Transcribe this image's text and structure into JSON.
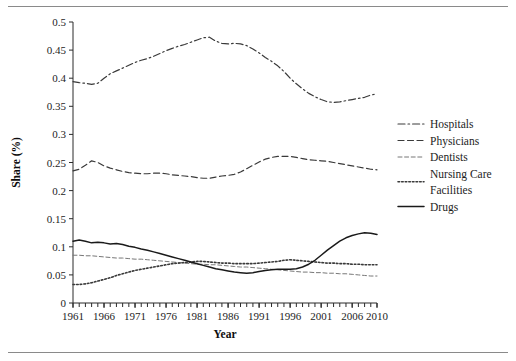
{
  "figure": {
    "has_top_rule": true,
    "has_bottom_rule": true,
    "background": "#ffffff",
    "line_color": "#333333"
  },
  "chart_data": {
    "type": "line",
    "title": "",
    "subtitle": "",
    "xlabel": "Year",
    "ylabel": "Share (%)",
    "xlim": [
      1961,
      2010
    ],
    "ylim": [
      0,
      0.5
    ],
    "grid": false,
    "legend_position": "right",
    "y_ticks": [
      0,
      0.05,
      0.1,
      0.15,
      0.2,
      0.25,
      0.3,
      0.35,
      0.4,
      0.45,
      0.5
    ],
    "y_tick_labels": [
      "0",
      "0.05",
      "0.1",
      "0.15",
      "0.2",
      "0.25",
      "0.3",
      "0.35",
      "0.4",
      "0.45",
      "0.5"
    ],
    "x_ticks": [
      1961,
      1966,
      1971,
      1976,
      1981,
      1986,
      1991,
      1996,
      2001,
      2006,
      2010
    ],
    "x_tick_labels": [
      "1961",
      "1966",
      "1971",
      "1976",
      "1981",
      "1986",
      "1991",
      "1996",
      "2001",
      "2006",
      "2010"
    ],
    "x_minor_tick_step": 1,
    "x": [
      1961,
      1962,
      1963,
      1964,
      1965,
      1966,
      1967,
      1968,
      1969,
      1970,
      1971,
      1972,
      1973,
      1974,
      1975,
      1976,
      1977,
      1978,
      1979,
      1980,
      1981,
      1982,
      1983,
      1984,
      1985,
      1986,
      1987,
      1988,
      1989,
      1990,
      1991,
      1992,
      1993,
      1994,
      1995,
      1996,
      1997,
      1998,
      1999,
      2000,
      2001,
      2002,
      2003,
      2004,
      2005,
      2006,
      2007,
      2008,
      2009,
      2010
    ],
    "series": [
      {
        "name": "Hospitals",
        "style": "dashdot",
        "color": "#3a3a3a",
        "values": [
          0.394,
          0.392,
          0.391,
          0.389,
          0.391,
          0.4,
          0.408,
          0.413,
          0.418,
          0.423,
          0.428,
          0.432,
          0.435,
          0.439,
          0.444,
          0.449,
          0.453,
          0.457,
          0.46,
          0.464,
          0.468,
          0.472,
          0.473,
          0.466,
          0.462,
          0.461,
          0.462,
          0.461,
          0.458,
          0.452,
          0.445,
          0.437,
          0.43,
          0.422,
          0.412,
          0.4,
          0.39,
          0.381,
          0.373,
          0.367,
          0.362,
          0.358,
          0.357,
          0.358,
          0.36,
          0.362,
          0.364,
          0.366,
          0.37,
          0.372
        ]
      },
      {
        "name": "Physicians",
        "style": "dashed",
        "color": "#3a3a3a",
        "values": [
          0.235,
          0.238,
          0.245,
          0.253,
          0.25,
          0.244,
          0.24,
          0.237,
          0.234,
          0.232,
          0.231,
          0.23,
          0.23,
          0.231,
          0.231,
          0.23,
          0.228,
          0.227,
          0.226,
          0.225,
          0.223,
          0.222,
          0.222,
          0.224,
          0.226,
          0.227,
          0.229,
          0.233,
          0.239,
          0.245,
          0.251,
          0.256,
          0.259,
          0.261,
          0.261,
          0.261,
          0.259,
          0.257,
          0.255,
          0.254,
          0.253,
          0.252,
          0.25,
          0.248,
          0.246,
          0.244,
          0.242,
          0.24,
          0.238,
          0.237
        ]
      },
      {
        "name": "Dentists",
        "style": "finedash",
        "color": "#777777",
        "values": [
          0.085,
          0.085,
          0.084,
          0.084,
          0.083,
          0.082,
          0.081,
          0.08,
          0.08,
          0.079,
          0.078,
          0.078,
          0.077,
          0.076,
          0.075,
          0.074,
          0.073,
          0.072,
          0.071,
          0.07,
          0.069,
          0.069,
          0.068,
          0.068,
          0.067,
          0.066,
          0.065,
          0.064,
          0.064,
          0.063,
          0.062,
          0.061,
          0.06,
          0.059,
          0.058,
          0.057,
          0.056,
          0.055,
          0.055,
          0.054,
          0.054,
          0.053,
          0.053,
          0.052,
          0.052,
          0.051,
          0.05,
          0.049,
          0.048,
          0.048
        ]
      },
      {
        "name": "Nursing Care Facilities",
        "style": "dotted",
        "color": "#3a3a3a",
        "values": [
          0.033,
          0.033,
          0.034,
          0.036,
          0.039,
          0.042,
          0.045,
          0.049,
          0.052,
          0.055,
          0.058,
          0.06,
          0.062,
          0.064,
          0.066,
          0.068,
          0.07,
          0.071,
          0.072,
          0.073,
          0.074,
          0.074,
          0.073,
          0.072,
          0.071,
          0.071,
          0.07,
          0.07,
          0.07,
          0.07,
          0.071,
          0.072,
          0.073,
          0.074,
          0.076,
          0.077,
          0.076,
          0.075,
          0.074,
          0.073,
          0.072,
          0.071,
          0.071,
          0.07,
          0.07,
          0.069,
          0.069,
          0.068,
          0.068,
          0.068
        ]
      },
      {
        "name": "Drugs",
        "style": "solid",
        "color": "#1a1a1a",
        "values": [
          0.11,
          0.112,
          0.11,
          0.107,
          0.108,
          0.107,
          0.105,
          0.106,
          0.104,
          0.101,
          0.099,
          0.096,
          0.094,
          0.091,
          0.088,
          0.085,
          0.082,
          0.079,
          0.076,
          0.073,
          0.07,
          0.067,
          0.064,
          0.061,
          0.059,
          0.057,
          0.055,
          0.054,
          0.053,
          0.054,
          0.056,
          0.058,
          0.059,
          0.06,
          0.06,
          0.06,
          0.061,
          0.064,
          0.069,
          0.076,
          0.085,
          0.094,
          0.102,
          0.11,
          0.116,
          0.12,
          0.123,
          0.125,
          0.124,
          0.122
        ]
      }
    ]
  },
  "legend": {
    "entries": [
      {
        "label": "Hospitals",
        "style": "dashdot"
      },
      {
        "label": "Physicians",
        "style": "dashed"
      },
      {
        "label": "Dentists",
        "style": "finedash"
      },
      {
        "label": "Nursing Care",
        "label2": "Facilities",
        "style": "dotted"
      },
      {
        "label": "Drugs",
        "style": "solid"
      }
    ]
  }
}
